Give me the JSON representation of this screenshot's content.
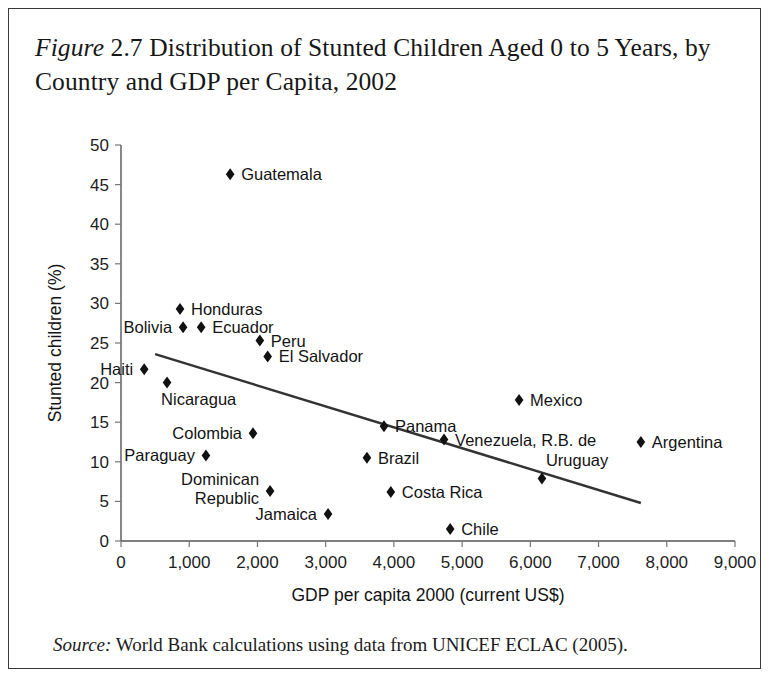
{
  "figure": {
    "label": "Figure",
    "number": "2.7",
    "title": "Distribution of Stunted Children Aged 0 to 5 Years, by Country and GDP per Capita, 2002",
    "title_line1": "Figure 2.7 Distribution of Stunted Children Aged 0 to 5",
    "title_line2": "Years, by Country and GDP per Capita, 2002"
  },
  "source": {
    "label": "Source:",
    "text": "World Bank calculations using data from UNICEF ECLAC (2005)."
  },
  "chart_data": {
    "type": "scatter",
    "title": "Distribution of Stunted Children Aged 0 to 5 Years, by Country and GDP per Capita, 2002",
    "xlabel": "GDP per capita 2000 (current US$)",
    "ylabel": "Stunted children (%)",
    "xlim": [
      0,
      9000
    ],
    "ylim": [
      0,
      50
    ],
    "xticks": [
      0,
      1000,
      2000,
      3000,
      4000,
      5000,
      6000,
      7000,
      8000,
      9000
    ],
    "xtick_labels": [
      "0",
      "1,000",
      "2,000",
      "3,000",
      "4,000",
      "5,000",
      "6,000",
      "7,000",
      "8,000",
      "9,000"
    ],
    "yticks": [
      0,
      5,
      10,
      15,
      20,
      25,
      30,
      35,
      40,
      45,
      50
    ],
    "ytick_labels": [
      "0",
      "5",
      "10",
      "15",
      "20",
      "25",
      "30",
      "35",
      "40",
      "45",
      "50"
    ],
    "grid": false,
    "legend": "none",
    "marker": "diamond",
    "marker_color": "#111111",
    "trendline": {
      "type": "linear",
      "color": "#333333",
      "x_start": 500,
      "y_start": 23.6,
      "x_end": 7620,
      "y_end": 4.8
    },
    "points": [
      {
        "country": "Guatemala",
        "gdp": 1600,
        "stunting": 46.3,
        "label_side": "right"
      },
      {
        "country": "Honduras",
        "gdp": 865,
        "stunting": 29.3,
        "label_side": "right"
      },
      {
        "country": "Bolivia",
        "gdp": 910,
        "stunting": 27.0,
        "label_side": "left"
      },
      {
        "country": "Ecuador",
        "gdp": 1175,
        "stunting": 27.0,
        "label_side": "right"
      },
      {
        "country": "Peru",
        "gdp": 2035,
        "stunting": 25.3,
        "label_side": "right"
      },
      {
        "country": "El Salvador",
        "gdp": 2150,
        "stunting": 23.3,
        "label_side": "right"
      },
      {
        "country": "Haiti",
        "gdp": 340,
        "stunting": 21.7,
        "label_side": "left"
      },
      {
        "country": "Nicaragua",
        "gdp": 675,
        "stunting": 20.0,
        "label_side": "below"
      },
      {
        "country": "Mexico",
        "gdp": 5835,
        "stunting": 17.8,
        "label_side": "right"
      },
      {
        "country": "Panama",
        "gdp": 3855,
        "stunting": 14.5,
        "label_side": "right"
      },
      {
        "country": "Colombia",
        "gdp": 1935,
        "stunting": 13.6,
        "label_side": "left"
      },
      {
        "country": "Venezuela, R.B. de",
        "gdp": 4735,
        "stunting": 12.8,
        "label_side": "right"
      },
      {
        "country": "Argentina",
        "gdp": 7620,
        "stunting": 12.5,
        "label_side": "right"
      },
      {
        "country": "Paraguay",
        "gdp": 1245,
        "stunting": 10.8,
        "label_side": "left"
      },
      {
        "country": "Brazil",
        "gdp": 3605,
        "stunting": 10.5,
        "label_side": "right"
      },
      {
        "country": "Uruguay",
        "gdp": 6170,
        "stunting": 7.9,
        "label_side": "above"
      },
      {
        "country": "Dominican Republic",
        "gdp": 2185,
        "stunting": 6.3,
        "label_side": "left"
      },
      {
        "country": "Costa Rica",
        "gdp": 3955,
        "stunting": 6.2,
        "label_side": "right"
      },
      {
        "country": "Jamaica",
        "gdp": 3035,
        "stunting": 3.4,
        "label_side": "left"
      },
      {
        "country": "Chile",
        "gdp": 4825,
        "stunting": 1.5,
        "label_side": "right"
      }
    ]
  }
}
